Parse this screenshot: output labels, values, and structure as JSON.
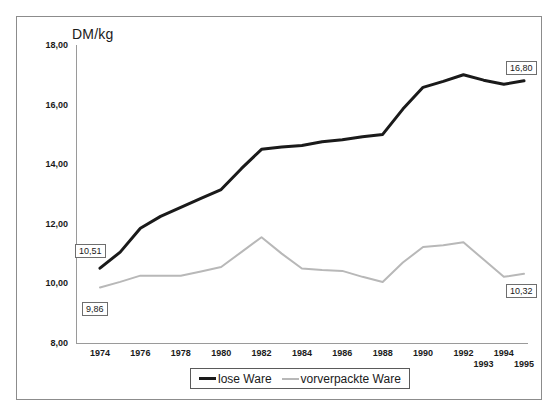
{
  "axis": {
    "y_axis_title": "DM/kg",
    "y_ticks": [
      "18,00",
      "16,00",
      "14,00",
      "12,00",
      "10,00",
      "8,00"
    ],
    "x_ticks_top": [
      "1974",
      "1976",
      "1978",
      "1980",
      "1982",
      "1984",
      "1986",
      "1988",
      "1990",
      "1992",
      "1994"
    ],
    "x_ticks_bottom": [
      "1993",
      "1995"
    ]
  },
  "legend": {
    "items": [
      {
        "label": "lose Ware",
        "color": "#1a1a1a",
        "width": 3
      },
      {
        "label": "vorverpackte Ware",
        "color": "#b8b8b8",
        "width": 2
      }
    ]
  },
  "data_labels": [
    {
      "name": "label-lose-1974",
      "text": "10,51"
    },
    {
      "name": "label-vorverpackt-1974",
      "text": "9,86"
    },
    {
      "name": "label-lose-1995",
      "text": "16,80"
    },
    {
      "name": "label-vorverpackt-1995",
      "text": "10,32"
    }
  ],
  "colors": {
    "series_lose": "#1a1a1a",
    "series_vorverpackt": "#b8b8b8",
    "axis": "#9a9a9a",
    "frame": "#8c8c8c",
    "text": "#1a1a1a",
    "background": "#ffffff"
  },
  "chart_data": {
    "type": "line",
    "title": "",
    "subtitle": "",
    "xlabel": "",
    "ylabel": "DM/kg",
    "ylim": [
      8.0,
      18.0
    ],
    "xlim": [
      1974,
      1995
    ],
    "ytick_values": [
      18.0,
      16.0,
      14.0,
      12.0,
      10.0,
      8.0
    ],
    "grid": false,
    "legend_position": "bottom",
    "x": [
      1974,
      1975,
      1976,
      1977,
      1978,
      1979,
      1980,
      1981,
      1982,
      1983,
      1984,
      1985,
      1986,
      1987,
      1988,
      1989,
      1990,
      1991,
      1992,
      1993,
      1994,
      1995
    ],
    "series": [
      {
        "name": "lose Ware",
        "color": "#1a1a1a",
        "values": [
          10.51,
          11.05,
          11.85,
          12.25,
          12.55,
          12.85,
          13.15,
          13.85,
          14.5,
          14.58,
          14.63,
          14.75,
          14.82,
          14.92,
          15.0,
          15.85,
          16.58,
          16.78,
          17.0,
          16.82,
          16.68,
          16.8
        ],
        "labels": {
          "1974": "10,51",
          "1995": "16,80"
        }
      },
      {
        "name": "vorverpackte Ware",
        "color": "#b8b8b8",
        "values": [
          9.86,
          10.05,
          10.26,
          10.26,
          10.26,
          10.4,
          10.55,
          11.05,
          11.55,
          11.0,
          10.5,
          10.45,
          10.42,
          10.22,
          10.05,
          10.7,
          11.22,
          11.28,
          11.38,
          10.8,
          10.22,
          10.32
        ],
        "labels": {
          "1974": "9,86",
          "1995": "10,32"
        }
      }
    ]
  }
}
